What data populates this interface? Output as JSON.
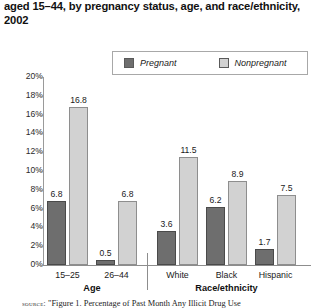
{
  "title": "aged 15–44, by pregnancy status, age, and race/ethnicity, 2002",
  "legend": {
    "items": [
      {
        "label": "Pregnant",
        "color": "#6e6e6e",
        "icon": "legend-swatch-icon"
      },
      {
        "label": "Nonpregnant",
        "color": "#d2d2d2",
        "icon": "legend-swatch-icon"
      }
    ]
  },
  "source": {
    "prefix": "source:",
    "text": "\"Figure 1. Percentage of Past Month Any Illicit Drug Use"
  },
  "chart_data": {
    "type": "bar",
    "title": "aged 15–44, by pregnancy status, age, and race/ethnicity, 2002",
    "xlabel": "",
    "ylabel": "",
    "ylim": [
      0,
      20
    ],
    "ytick_labels": [
      "0%",
      "2%",
      "4%",
      "6%",
      "8%",
      "10%",
      "12%",
      "14%",
      "16%",
      "18%",
      "20%"
    ],
    "ytick_values": [
      0,
      2,
      4,
      6,
      8,
      10,
      12,
      14,
      16,
      18,
      20
    ],
    "grid": false,
    "legend_position": "top-right",
    "categories": [
      "15–25",
      "26–44",
      "White",
      "Black",
      "Hispanic"
    ],
    "group_labels": [
      "Age",
      "Race/ethnicity"
    ],
    "groups": [
      {
        "name": "Age",
        "categories": [
          "15–25",
          "26–44"
        ]
      },
      {
        "name": "Race/ethnicity",
        "categories": [
          "White",
          "Black",
          "Hispanic"
        ]
      }
    ],
    "series": [
      {
        "name": "Pregnant",
        "color": "#6e6e6e",
        "values": [
          6.8,
          0.5,
          3.6,
          6.2,
          1.7
        ]
      },
      {
        "name": "Nonpregnant",
        "color": "#d2d2d2",
        "values": [
          16.8,
          6.8,
          11.5,
          8.9,
          7.5
        ]
      }
    ]
  }
}
